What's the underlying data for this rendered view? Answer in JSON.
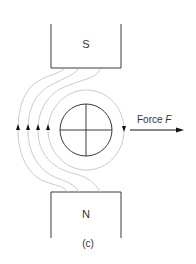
{
  "diagram": {
    "type": "magnetic-field-force-on-conductor",
    "top_magnet": {
      "label": "S"
    },
    "bottom_magnet": {
      "label": "N"
    },
    "conductor": {
      "symbol": "cross",
      "meaning": "current into page"
    },
    "force": {
      "label_text": "Force ",
      "label_var": "F",
      "direction": "right"
    },
    "caption": "(c)",
    "colors": {
      "outline": "#3a3a3a",
      "field_lines": "#c4c4c4",
      "text": "#333333",
      "arrows": "#111111"
    }
  }
}
